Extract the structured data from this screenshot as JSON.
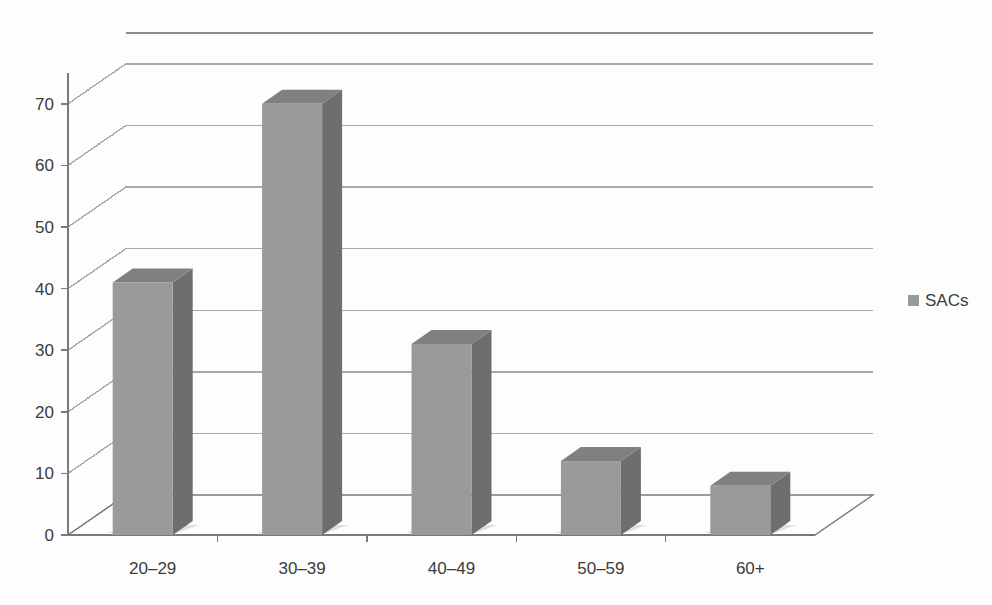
{
  "chart_data": {
    "type": "bar",
    "title": "",
    "subtitle": "",
    "xlabel": "",
    "ylabel": "",
    "categories": [
      "20–29",
      "30–39",
      "40–49",
      "50–59",
      "60+"
    ],
    "series": [
      {
        "name": "SACs",
        "values": [
          41,
          70,
          31,
          12,
          8
        ]
      }
    ],
    "ylim": [
      0,
      75
    ],
    "yticks": [
      0,
      10,
      20,
      30,
      40,
      50,
      60,
      70
    ],
    "ytick_labels": [
      "0",
      "10",
      "20",
      "30",
      "40",
      "50",
      "60",
      "70"
    ],
    "grid": true,
    "grid_axis": "y",
    "legend": {
      "position": "right",
      "entries": [
        {
          "label": "SACs",
          "marker": "square",
          "color": "#9a9a9a"
        }
      ]
    },
    "style": {
      "three_d": true,
      "bar_face_color": "#9a9a9a",
      "bar_side_color": "#6e6e6e",
      "bar_top_color": "#808080",
      "grid_color": "#a9a9a9",
      "axis_color": "#7a7a7a",
      "background": "#ffffff",
      "text_color": "#3b3b3b"
    },
    "annotations": []
  }
}
